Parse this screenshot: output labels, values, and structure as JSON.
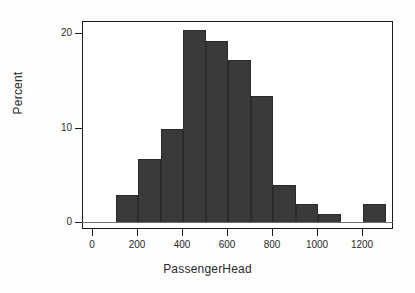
{
  "chart_data": {
    "type": "bar",
    "title": "",
    "subtitle": "",
    "xlabel": "PassengerHead",
    "ylabel": "Percent",
    "grid": false,
    "legend": "none",
    "bin_width": 100,
    "xlim": [
      0,
      1300
    ],
    "ylim": [
      0,
      21.5
    ],
    "xticks": [
      0,
      200,
      400,
      600,
      800,
      1000,
      1200
    ],
    "xtick_labels": [
      "0",
      "200",
      "400",
      "600",
      "800",
      "1000",
      "1200"
    ],
    "yticks": [
      0,
      10,
      20
    ],
    "ytick_labels": [
      "0",
      "10",
      "20"
    ],
    "bin_starts": [
      100,
      200,
      300,
      400,
      500,
      600,
      700,
      800,
      900,
      1000,
      1100,
      1200
    ],
    "bin_ends": [
      200,
      300,
      400,
      500,
      600,
      700,
      800,
      900,
      1000,
      1100,
      1200,
      1300
    ],
    "categories": [
      "100-200",
      "200-300",
      "300-400",
      "400-500",
      "500-600",
      "600-700",
      "700-800",
      "800-900",
      "900-1000",
      "1000-1100",
      "1100-1200",
      "1200-1300"
    ],
    "values": [
      3.0,
      6.8,
      10.0,
      20.4,
      19.3,
      17.3,
      13.4,
      4.0,
      2.0,
      1.0,
      0.0,
      2.0
    ],
    "bar_color": "#3a3a3a",
    "bar_edge_color": "#2b2b2b",
    "axis_color": "#1a1a1a"
  }
}
